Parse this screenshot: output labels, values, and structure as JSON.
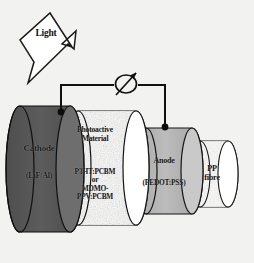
{
  "figure": {
    "background_color": "#f2f2f0",
    "width": 254,
    "height": 263
  },
  "light": {
    "label": "Light",
    "icon": "lightning-bolt-arrow-icon",
    "direction": "down-left"
  },
  "circuit": {
    "meter": {
      "icon": "variable-meter-icon",
      "symbol": "circle-with-diagonal-arrow",
      "cx": 126,
      "cy": 84
    },
    "wire_color": "#111111",
    "left_terminal": {
      "x": 61,
      "y": 112
    },
    "right_terminal": {
      "x": 165,
      "y": 127
    }
  },
  "layers": [
    {
      "id": "cathode",
      "label": "Cathode",
      "sublabel": "(LiF/Al)",
      "fill": "#595959",
      "cap_fill": "#6b6b6b",
      "texture": "solid"
    },
    {
      "id": "photoactive",
      "label": "Photoactive\nMaterial",
      "sublabel": "P3HT:PCBM\nor\nMDMO-\nPPV:PCBM",
      "fill": "#dedbd6",
      "cap_fill": "#ffffff",
      "texture": "speckled"
    },
    {
      "id": "anode",
      "label": "Anode",
      "sublabel": "(PEDOT:PSS)",
      "fill": "#b3b3b3",
      "cap_fill": "#c4c4c4",
      "texture": "solid"
    },
    {
      "id": "pp-fibre",
      "label": "PP\nfibre",
      "sublabel": "",
      "fill": "#e8e6e2",
      "cap_fill": "#ffffff",
      "texture": "speckled"
    }
  ]
}
